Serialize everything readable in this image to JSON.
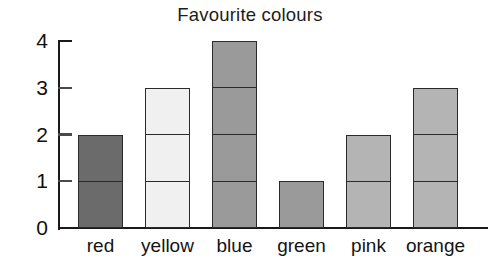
{
  "chart_data": {
    "type": "bar",
    "title": "Favourite colours",
    "xlabel": "",
    "ylabel": "",
    "categories": [
      "red",
      "yellow",
      "blue",
      "green",
      "pink",
      "orange"
    ],
    "values": [
      2,
      3,
      4,
      1,
      2,
      3
    ],
    "ylim": [
      0,
      4
    ],
    "ytick_labels": [
      "0",
      "1",
      "2",
      "3",
      "4"
    ],
    "ytick_values": [
      0,
      1,
      2,
      3,
      4
    ],
    "grid": false,
    "legend": "none",
    "stacked_unit_segments": true,
    "bar_fill_colors": [
      "#6b6b6b",
      "#f0f0f0",
      "#9a9a9a",
      "#9a9a9a",
      "#b4b4b4",
      "#b4b4b4"
    ],
    "bar_outline_color": "#2b2b2b",
    "axis_color": "#1a1a1a",
    "background_color": "#ffffff",
    "text_color": "#141414"
  }
}
